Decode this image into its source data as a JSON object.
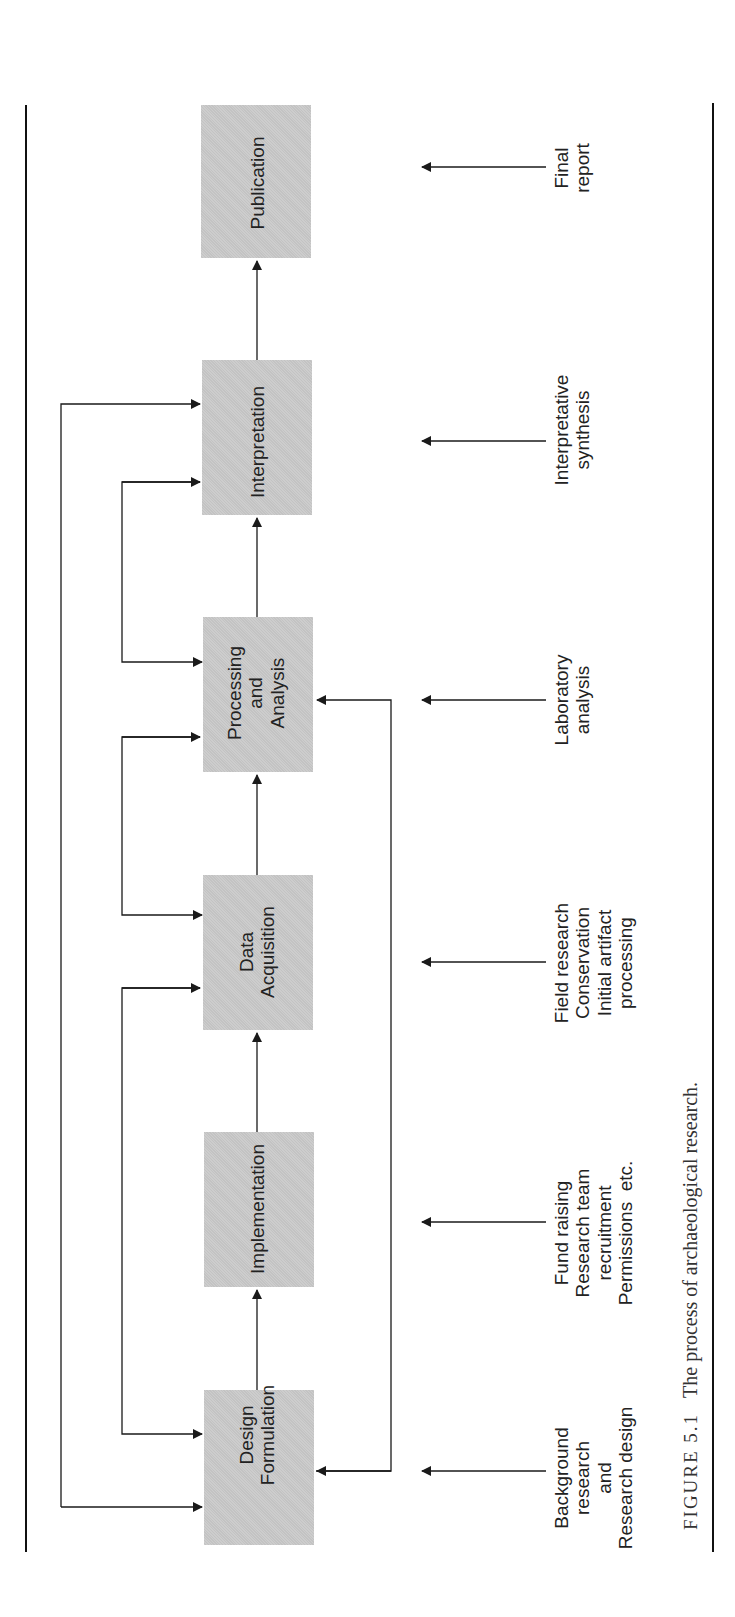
{
  "figure": {
    "number_label": "FIGURE 5.1",
    "caption": "The process of archaeological research."
  },
  "colors": {
    "box_fill": "#c9c9c9",
    "line": "#1a1a1a",
    "rule": "#111111"
  },
  "stages": [
    {
      "id": "design",
      "label": "Design\nFormulation",
      "note": "Background\nresearch\nand\nResearch design"
    },
    {
      "id": "implementation",
      "label": "Implementation",
      "note": "Fund raising\nResearch team\nrecruitment\nPermissions  etc."
    },
    {
      "id": "data",
      "label": "Data\nAcquisition",
      "note": "Field research\nConservation\nInitial artifact\nprocessing"
    },
    {
      "id": "processing",
      "label": "Processing\nand\nAnalysis",
      "note": "Laboratory\nanalysis"
    },
    {
      "id": "interpretation",
      "label": "Interpretation",
      "note": "Interpretative\nsynthesis"
    },
    {
      "id": "publication",
      "label": "Publication",
      "note": "Final\nreport"
    }
  ],
  "feedback_loops": [
    {
      "from": "interpretation",
      "to": "design",
      "type": "outer"
    },
    {
      "from": "interpretation",
      "to": "processing",
      "type": "inner"
    },
    {
      "from": "processing",
      "to": "data",
      "type": "inner"
    },
    {
      "from": "data",
      "to": "design",
      "type": "inner"
    },
    {
      "from": "design",
      "to": "processing",
      "type": "right-side"
    }
  ]
}
